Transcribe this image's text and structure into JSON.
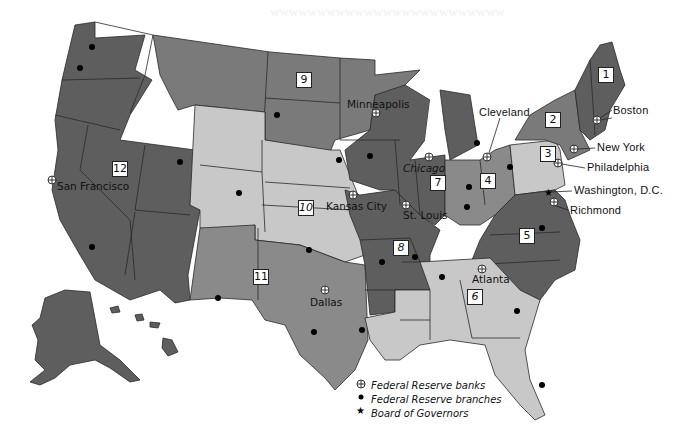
{
  "map": {
    "title": "Federal Reserve Districts",
    "districts": [
      {
        "number": "1",
        "bank_city": "Boston"
      },
      {
        "number": "2",
        "bank_city": "New York"
      },
      {
        "number": "3",
        "bank_city": "Philadelphia"
      },
      {
        "number": "4",
        "bank_city": "Cleveland"
      },
      {
        "number": "5",
        "bank_city": "Richmond"
      },
      {
        "number": "6",
        "bank_city": "Atlanta"
      },
      {
        "number": "7",
        "bank_city": "Chicago"
      },
      {
        "number": "8",
        "bank_city": "St. Louis"
      },
      {
        "number": "9",
        "bank_city": "Minneapolis"
      },
      {
        "number": "10",
        "bank_city": "Kansas City"
      },
      {
        "number": "11",
        "bank_city": "Dallas"
      },
      {
        "number": "12",
        "bank_city": "San Francisco"
      }
    ],
    "cities": {
      "san_francisco": "San Francisco",
      "minneapolis": "Minneapolis",
      "kansas_city": "Kansas City",
      "dallas": "Dallas",
      "chicago": "Chicago",
      "st_louis": "St. Louis",
      "cleveland": "Cleveland",
      "boston": "Boston",
      "new_york": "New York",
      "philadelphia": "Philadelphia",
      "washington": "Washington, D.C.",
      "richmond": "Richmond",
      "atlanta": "Atlanta"
    },
    "legend": {
      "banks": "Federal Reserve banks",
      "branches": "Federal Reserve branches",
      "board": "Board of Governors"
    },
    "colors": {
      "dark": "#5e5e5e",
      "medium": "#8a8a8a",
      "light": "#c8c8c8",
      "border": "#2a2a2a",
      "background": "#ffffff"
    }
  }
}
